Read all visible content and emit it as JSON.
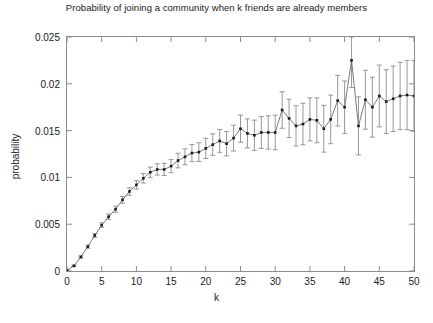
{
  "chart_data": {
    "type": "line",
    "title": "Probability of joining a community when k friends are already members",
    "xlabel": "k",
    "ylabel": "probability",
    "xlim": [
      0,
      50
    ],
    "ylim": [
      0,
      0.025
    ],
    "xticks": [
      0,
      5,
      10,
      15,
      20,
      25,
      30,
      35,
      40,
      45,
      50
    ],
    "xtick_labels": [
      "0",
      "5",
      "10",
      "15",
      "20",
      "25",
      "30",
      "35",
      "40",
      "45",
      "50"
    ],
    "yticks": [
      0,
      0.005,
      0.01,
      0.015,
      0.02,
      0.025
    ],
    "ytick_labels": [
      "0",
      "0.005",
      "0.01",
      "0.015",
      "0.02",
      "0.025"
    ],
    "grid": false,
    "legend": null,
    "marker": "square",
    "error_bars": true,
    "line_color": "#6b6b6b",
    "marker_color": "#1a1a1a",
    "errorbar_color": "#8c8c8c",
    "x": [
      0,
      1,
      2,
      3,
      4,
      5,
      6,
      7,
      8,
      9,
      10,
      11,
      12,
      13,
      14,
      15,
      16,
      17,
      18,
      19,
      20,
      21,
      22,
      23,
      24,
      25,
      26,
      27,
      28,
      29,
      30,
      31,
      32,
      33,
      34,
      35,
      36,
      37,
      38,
      39,
      40,
      41,
      42,
      43,
      44,
      45,
      46,
      47,
      48,
      49,
      50
    ],
    "y": [
      5e-05,
      0.00055,
      0.0015,
      0.0026,
      0.0038,
      0.0049,
      0.0058,
      0.0066,
      0.0076,
      0.0085,
      0.0092,
      0.0099,
      0.01055,
      0.01085,
      0.01085,
      0.0112,
      0.0118,
      0.0122,
      0.0126,
      0.0127,
      0.0131,
      0.0135,
      0.0139,
      0.0136,
      0.0142,
      0.0152,
      0.0147,
      0.0145,
      0.0148,
      0.0148,
      0.0148,
      0.0172,
      0.0163,
      0.0155,
      0.0157,
      0.0162,
      0.0161,
      0.0152,
      0.0162,
      0.0182,
      0.0175,
      0.0225,
      0.0155,
      0.0183,
      0.0175,
      0.0187,
      0.0181,
      0.0184,
      0.0187,
      0.0188,
      0.0187
    ],
    "yerr": [
      4e-05,
      8e-05,
      0.00012,
      0.00016,
      0.0002,
      0.00024,
      0.00028,
      0.00032,
      0.00036,
      0.0004,
      0.00045,
      0.0005,
      0.00055,
      0.0006,
      0.00065,
      0.0007,
      0.00078,
      0.00085,
      0.00092,
      0.001,
      0.00108,
      0.00115,
      0.00122,
      0.0013,
      0.00138,
      0.00145,
      0.00155,
      0.00162,
      0.0017,
      0.00178,
      0.00185,
      0.00195,
      0.00205,
      0.00215,
      0.00222,
      0.0023,
      0.0024,
      0.0025,
      0.0026,
      0.0027,
      0.0028,
      0.0029,
      0.0031,
      0.00315,
      0.0032,
      0.0033,
      0.0034,
      0.0035,
      0.0036,
      0.0037,
      0.0038
    ]
  }
}
